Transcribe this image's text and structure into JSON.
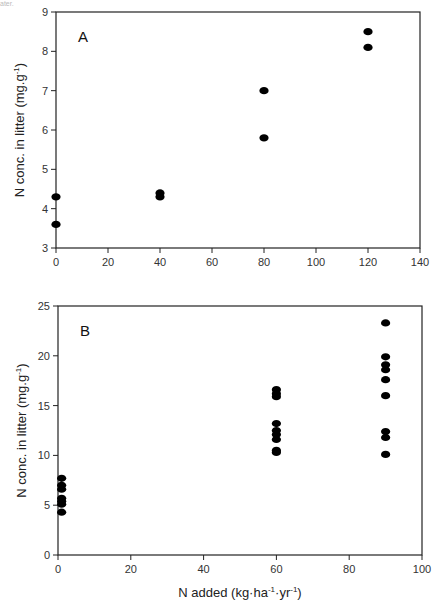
{
  "caption_fragment": "ater.",
  "chart_data": [
    {
      "type": "scatter",
      "panel_label": "A",
      "title": "",
      "xlabel": "",
      "ylabel": "N conc. in litter (mg.g-1)",
      "xlim": [
        0,
        140
      ],
      "ylim": [
        3,
        9
      ],
      "x_ticks": [
        0,
        20,
        40,
        60,
        80,
        100,
        120,
        140
      ],
      "y_ticks": [
        3,
        4,
        5,
        6,
        7,
        8,
        9
      ],
      "grid": false,
      "legend": null,
      "series": [
        {
          "name": "N concentration",
          "points": [
            {
              "x": 0,
              "y": 4.3
            },
            {
              "x": 0,
              "y": 3.6
            },
            {
              "x": 40,
              "y": 4.4
            },
            {
              "x": 40,
              "y": 4.3
            },
            {
              "x": 80,
              "y": 7.0
            },
            {
              "x": 80,
              "y": 5.8
            },
            {
              "x": 120,
              "y": 8.5
            },
            {
              "x": 120,
              "y": 8.1
            }
          ]
        }
      ]
    },
    {
      "type": "scatter",
      "panel_label": "B",
      "title": "",
      "xlabel": "N added (kg·ha-1·yr-1)",
      "ylabel": "N conc. in litter (mg.g-1)",
      "xlim": [
        0,
        100
      ],
      "ylim": [
        0,
        25
      ],
      "x_ticks": [
        0,
        20,
        40,
        60,
        80,
        100
      ],
      "y_ticks": [
        0,
        5,
        10,
        15,
        20,
        25
      ],
      "grid": false,
      "legend": null,
      "series": [
        {
          "name": "N concentration",
          "points": [
            {
              "x": 1,
              "y": 7.7
            },
            {
              "x": 1,
              "y": 7.0
            },
            {
              "x": 1,
              "y": 6.6
            },
            {
              "x": 1,
              "y": 5.7
            },
            {
              "x": 1,
              "y": 5.4
            },
            {
              "x": 1,
              "y": 5.1
            },
            {
              "x": 1,
              "y": 4.3
            },
            {
              "x": 60,
              "y": 16.6
            },
            {
              "x": 60,
              "y": 16.2
            },
            {
              "x": 60,
              "y": 15.9
            },
            {
              "x": 60,
              "y": 13.2
            },
            {
              "x": 60,
              "y": 12.5
            },
            {
              "x": 60,
              "y": 12.1
            },
            {
              "x": 60,
              "y": 11.6
            },
            {
              "x": 60,
              "y": 10.5
            },
            {
              "x": 60,
              "y": 10.3
            },
            {
              "x": 90,
              "y": 23.3
            },
            {
              "x": 90,
              "y": 19.9
            },
            {
              "x": 90,
              "y": 19.1
            },
            {
              "x": 90,
              "y": 18.6
            },
            {
              "x": 90,
              "y": 17.6
            },
            {
              "x": 90,
              "y": 16.0
            },
            {
              "x": 90,
              "y": 12.4
            },
            {
              "x": 90,
              "y": 11.8
            },
            {
              "x": 90,
              "y": 10.1
            }
          ]
        }
      ]
    }
  ],
  "layout": {
    "panels": [
      {
        "left": 56,
        "right": 420,
        "top": 12,
        "bottom": 248
      },
      {
        "left": 58,
        "right": 422,
        "top": 306,
        "bottom": 555
      }
    ],
    "colors": {
      "marker": "#000000",
      "axis": "#222222"
    }
  }
}
